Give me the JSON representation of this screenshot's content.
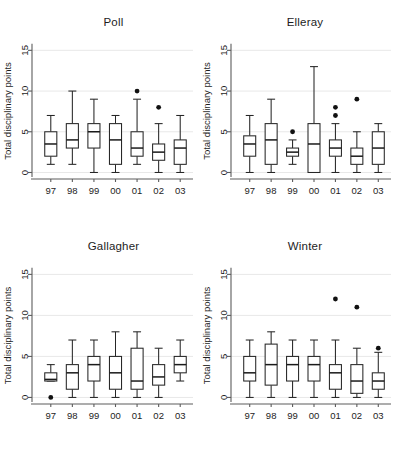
{
  "figure": {
    "width": 397,
    "height": 449,
    "background": "#ffffff",
    "ink_color": "#1d1d1d",
    "grid_color": "#e8e8e8"
  },
  "axis": {
    "y_label": "Total disciplinary points",
    "y_ticks": [
      "0",
      "5",
      "10",
      "15"
    ],
    "y_tick_values": [
      0,
      5,
      10,
      15
    ],
    "ylim": [
      -0.6,
      15.8
    ],
    "x_ticks": [
      "97",
      "98",
      "99",
      "00",
      "01",
      "02",
      "03"
    ]
  },
  "panels": [
    {
      "title": "Poll"
    },
    {
      "title": "Elleray"
    },
    {
      "title": "Gallagher"
    },
    {
      "title": "Winter"
    }
  ],
  "chart_data": {
    "type": "box",
    "xlabel": "",
    "ylabel": "Total disciplinary points",
    "categories": [
      "97",
      "98",
      "99",
      "00",
      "01",
      "02",
      "03"
    ],
    "ylim": [
      0,
      15
    ],
    "yticks": [
      0,
      5,
      10,
      15
    ],
    "grid": "horizontal",
    "legend": "none",
    "panel_layout": "2x2",
    "panels": [
      {
        "name": "Poll",
        "boxes": [
          {
            "category": "97",
            "lower_whisker": 1,
            "q1": 2,
            "median": 3.5,
            "q3": 5,
            "upper_whisker": 7,
            "outliers": []
          },
          {
            "category": "98",
            "lower_whisker": 1,
            "q1": 3,
            "median": 4,
            "q3": 6,
            "upper_whisker": 10,
            "outliers": []
          },
          {
            "category": "99",
            "lower_whisker": 0,
            "q1": 3,
            "median": 5,
            "q3": 6,
            "upper_whisker": 9,
            "outliers": []
          },
          {
            "category": "00",
            "lower_whisker": 0,
            "q1": 1,
            "median": 4,
            "q3": 6,
            "upper_whisker": 7,
            "outliers": []
          },
          {
            "category": "01",
            "lower_whisker": 1,
            "q1": 2,
            "median": 3,
            "q3": 5,
            "upper_whisker": 9,
            "outliers": [
              10
            ]
          },
          {
            "category": "02",
            "lower_whisker": 0,
            "q1": 1.5,
            "median": 2.5,
            "q3": 3.5,
            "upper_whisker": 6,
            "outliers": [
              8
            ]
          },
          {
            "category": "03",
            "lower_whisker": 0,
            "q1": 1,
            "median": 3,
            "q3": 4,
            "upper_whisker": 7,
            "outliers": []
          }
        ]
      },
      {
        "name": "Elleray",
        "boxes": [
          {
            "category": "97",
            "lower_whisker": 0,
            "q1": 2,
            "median": 3.5,
            "q3": 4.5,
            "upper_whisker": 7,
            "outliers": []
          },
          {
            "category": "98",
            "lower_whisker": 0,
            "q1": 1,
            "median": 4,
            "q3": 6,
            "upper_whisker": 9,
            "outliers": []
          },
          {
            "category": "99",
            "lower_whisker": 1,
            "q1": 2,
            "median": 2.5,
            "q3": 3,
            "upper_whisker": 4,
            "outliers": [
              5
            ]
          },
          {
            "category": "00",
            "lower_whisker": 0,
            "q1": 0,
            "median": 3.5,
            "q3": 6,
            "upper_whisker": 13,
            "outliers": []
          },
          {
            "category": "01",
            "lower_whisker": 0,
            "q1": 2,
            "median": 3,
            "q3": 4,
            "upper_whisker": 6,
            "outliers": [
              7,
              8
            ]
          },
          {
            "category": "02",
            "lower_whisker": 0,
            "q1": 1,
            "median": 2,
            "q3": 3,
            "upper_whisker": 5,
            "outliers": [
              9
            ]
          },
          {
            "category": "03",
            "lower_whisker": 0,
            "q1": 1,
            "median": 3,
            "q3": 5,
            "upper_whisker": 6,
            "outliers": []
          }
        ]
      },
      {
        "name": "Gallagher",
        "boxes": [
          {
            "category": "97",
            "lower_whisker": 2,
            "q1": 2,
            "median": 2.2,
            "q3": 3,
            "upper_whisker": 4,
            "outliers": [
              0
            ]
          },
          {
            "category": "98",
            "lower_whisker": 0,
            "q1": 1,
            "median": 3,
            "q3": 4,
            "upper_whisker": 7,
            "outliers": []
          },
          {
            "category": "99",
            "lower_whisker": 0,
            "q1": 2,
            "median": 4,
            "q3": 5,
            "upper_whisker": 7,
            "outliers": []
          },
          {
            "category": "00",
            "lower_whisker": 0,
            "q1": 1,
            "median": 3,
            "q3": 5,
            "upper_whisker": 8,
            "outliers": []
          },
          {
            "category": "01",
            "lower_whisker": 0,
            "q1": 1,
            "median": 2,
            "q3": 6,
            "upper_whisker": 8,
            "outliers": []
          },
          {
            "category": "02",
            "lower_whisker": 0,
            "q1": 1.5,
            "median": 2.5,
            "q3": 4,
            "upper_whisker": 6,
            "outliers": []
          },
          {
            "category": "03",
            "lower_whisker": 2,
            "q1": 3,
            "median": 4,
            "q3": 5,
            "upper_whisker": 7,
            "outliers": []
          }
        ]
      },
      {
        "name": "Winter",
        "boxes": [
          {
            "category": "97",
            "lower_whisker": 0,
            "q1": 2,
            "median": 3,
            "q3": 5,
            "upper_whisker": 7,
            "outliers": []
          },
          {
            "category": "98",
            "lower_whisker": 0,
            "q1": 1.5,
            "median": 4,
            "q3": 6.5,
            "upper_whisker": 8,
            "outliers": []
          },
          {
            "category": "99",
            "lower_whisker": 0,
            "q1": 2,
            "median": 4,
            "q3": 5,
            "upper_whisker": 7,
            "outliers": []
          },
          {
            "category": "00",
            "lower_whisker": 0,
            "q1": 2,
            "median": 4,
            "q3": 5,
            "upper_whisker": 7,
            "outliers": []
          },
          {
            "category": "01",
            "lower_whisker": 0,
            "q1": 1,
            "median": 3,
            "q3": 4,
            "upper_whisker": 7,
            "outliers": [
              12
            ]
          },
          {
            "category": "02",
            "lower_whisker": 0,
            "q1": 0.5,
            "median": 2,
            "q3": 4,
            "upper_whisker": 6,
            "outliers": [
              11
            ]
          },
          {
            "category": "03",
            "lower_whisker": 0,
            "q1": 1,
            "median": 2,
            "q3": 3,
            "upper_whisker": 5.5,
            "outliers": [
              6
            ]
          }
        ]
      }
    ]
  }
}
